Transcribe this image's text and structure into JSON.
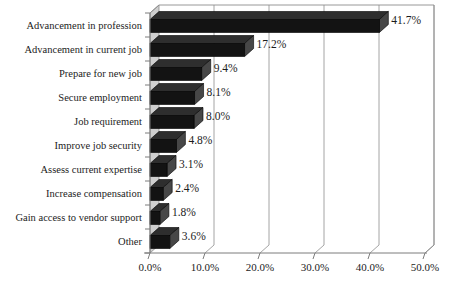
{
  "chart_data": {
    "type": "bar",
    "orientation": "horizontal",
    "title": "",
    "subtitle": "",
    "xlabel": "",
    "ylabel": "",
    "categories": [
      "Advancement in profession",
      "Advancement in current job",
      "Prepare for new job",
      "Secure employment",
      "Job requirement",
      "Improve job security",
      "Assess current expertise",
      "Increase compensation",
      "Gain access to vendor support",
      "Other"
    ],
    "values": [
      41.7,
      17.2,
      9.4,
      8.1,
      8.0,
      4.8,
      3.1,
      2.4,
      1.8,
      3.6
    ],
    "value_labels": [
      "41.7%",
      "17.2%",
      "9.4%",
      "8.1%",
      "8.0%",
      "4.8%",
      "3.1%",
      "2.4%",
      "1.8%",
      "3.6%"
    ],
    "xlim": [
      0,
      50
    ],
    "x_ticks": [
      0,
      10,
      20,
      30,
      40,
      50
    ],
    "x_tick_labels": [
      "0.0%",
      "10.0%",
      "20.0%",
      "30.0%",
      "40.0%",
      "50.0%"
    ],
    "grid": true,
    "legend": false,
    "style": "3d",
    "bar_color": "#131313",
    "wall_color": "#cfcfcf",
    "grid_color": "#9a9a9a",
    "background_color": "#ffffff"
  }
}
